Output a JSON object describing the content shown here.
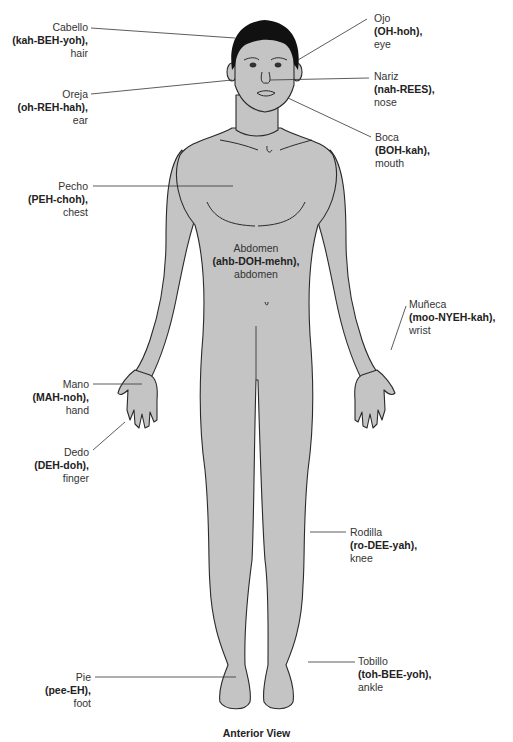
{
  "diagram": {
    "caption": "Anterior View",
    "colors": {
      "skin": "#c4c4c4",
      "outline": "#2a2a2a",
      "hair": "#111111",
      "leader": "#333333"
    },
    "labels": {
      "cabello": {
        "spanish": "Cabello",
        "pronunciation": "(kah-BEH-yoh),",
        "english": "hair"
      },
      "oreja": {
        "spanish": "Oreja",
        "pronunciation": "(oh-REH-hah),",
        "english": "ear"
      },
      "ojo": {
        "spanish": "Ojo",
        "pronunciation": "(OH-hoh),",
        "english": "eye"
      },
      "nariz": {
        "spanish": "Nariz",
        "pronunciation": "(nah-REES),",
        "english": "nose"
      },
      "boca": {
        "spanish": "Boca",
        "pronunciation": "(BOH-kah),",
        "english": "mouth"
      },
      "pecho": {
        "spanish": "Pecho",
        "pronunciation": "(PEH-choh),",
        "english": "chest"
      },
      "abdomen": {
        "spanish": "Abdomen",
        "pronunciation": "(ahb-DOH-mehn),",
        "english": "abdomen"
      },
      "muneca": {
        "spanish": "Muñeca",
        "pronunciation": "(moo-NYEH-kah),",
        "english": "wrist"
      },
      "mano": {
        "spanish": "Mano",
        "pronunciation": "(MAH-noh),",
        "english": "hand"
      },
      "dedo": {
        "spanish": "Dedo",
        "pronunciation": "(DEH-doh),",
        "english": "finger"
      },
      "rodilla": {
        "spanish": "Rodilla",
        "pronunciation": "(ro-DEE-yah),",
        "english": "knee"
      },
      "pie": {
        "spanish": "Pie",
        "pronunciation": "(pee-EH),",
        "english": "foot"
      },
      "tobillo": {
        "spanish": "Tobillo",
        "pronunciation": "(toh-BEE-yoh),",
        "english": "ankle"
      }
    }
  }
}
